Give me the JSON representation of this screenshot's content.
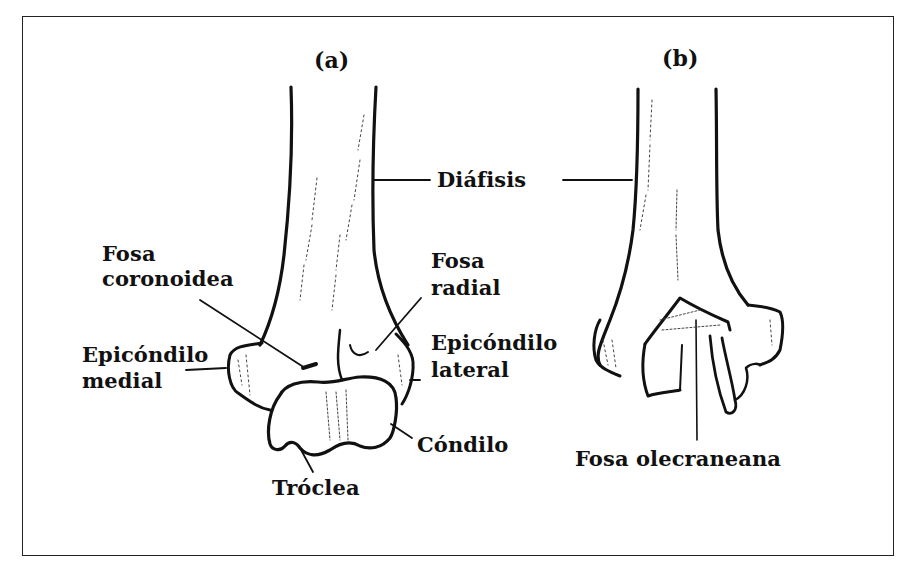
{
  "figure": {
    "panels": [
      {
        "id": "a",
        "label": "(a)"
      },
      {
        "id": "b",
        "label": "(b)"
      }
    ],
    "labels": {
      "diafisis": "Diáfisis",
      "fosa_coronoidea_1": "Fosa",
      "fosa_coronoidea_2": "coronoidea",
      "fosa_radial_1": "Fosa",
      "fosa_radial_2": "radial",
      "epicondilo_lateral_1": "Epicóndilo",
      "epicondilo_lateral_2": "lateral",
      "epicondilo_medial_1": "Epicóndilo",
      "epicondilo_medial_2": "medial",
      "condilo": "Cóndilo",
      "troclea": "Tróclea",
      "fosa_olecraneana": "Fosa olecraneana"
    },
    "colors": {
      "ink": "#111111",
      "background": "#ffffff",
      "border": "#222222"
    }
  }
}
